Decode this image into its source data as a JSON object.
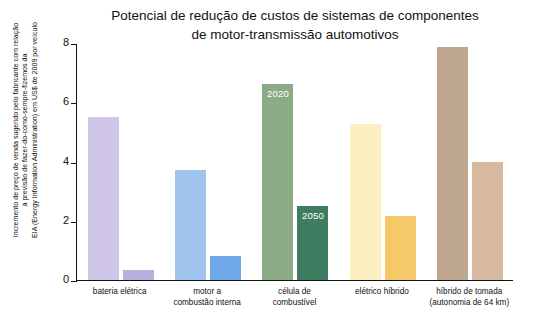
{
  "chart_data": {
    "type": "bar",
    "title": "Potencial de redução de custos de sistemas de componentes de motor-transmissão automotivos",
    "title_line1": "Potencial de redução de custos de sistemas de componentes",
    "title_line2": "de motor-transmissão automotivos",
    "xlabel": "",
    "ylabel": "Incremento de preço de venda sugerido pelo fabricante com relação à previsão de fazer-do-como-sempre-fizemos da EIA (Energy Information Administration) em US$ de 2009 por veículo",
    "ylabel_lines": [
      "Incremento de preço de venda sugerido pelo fabricante com relação",
      "à previsão de fazer-do-como-sempre-fizemos da",
      "EIA (Energy Information Administration) em US$ de 2009 por veículo"
    ],
    "ylim": [
      0,
      8
    ],
    "yticks": [
      0,
      2,
      4,
      6,
      8
    ],
    "grid": false,
    "legend": "none",
    "series": [
      {
        "name": "2020",
        "values": [
          5.5,
          3.7,
          6.6,
          5.25,
          7.85
        ]
      },
      {
        "name": "2050",
        "values": [
          0.35,
          0.8,
          2.5,
          2.15,
          4.0
        ]
      }
    ],
    "categories": [
      {
        "lines": [
          "bateria elétrica"
        ]
      },
      {
        "lines": [
          "motor a",
          "combustão interna"
        ]
      },
      {
        "lines": [
          "célula de",
          "combustível"
        ]
      },
      {
        "lines": [
          "elétrico híbrido"
        ]
      },
      {
        "lines": [
          "híbrido de tomada",
          "(autonomia de 64 km)"
        ]
      }
    ],
    "annotations": [
      {
        "text": "2020",
        "group": 2,
        "series": 0
      },
      {
        "text": "2050",
        "group": 2,
        "series": 1
      }
    ],
    "colors": {
      "axis": "#111111",
      "groups": [
        {
          "s2020": "#cfc6e8",
          "s2050": "#b9aedd"
        },
        {
          "s2020": "#9fc4ee",
          "s2050": "#6fa8e6"
        },
        {
          "s2020": "#8aab86",
          "s2050": "#3f7d63"
        },
        {
          "s2020": "#fcf0c2",
          "s2050": "#f5c96a"
        },
        {
          "s2020": "#bfa68f",
          "s2050": "#d8b9a0"
        }
      ]
    }
  }
}
